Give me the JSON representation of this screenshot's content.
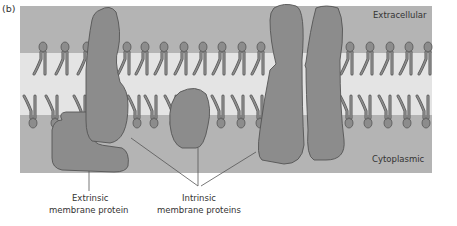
{
  "panel_label": "(b)",
  "regions": {
    "top": "Extracellular",
    "bottom": "Cytoplasmic"
  },
  "callouts": {
    "extrinsic": {
      "line1": "Extrinsic",
      "line2": "membrane protein"
    },
    "intrinsic": {
      "line1": "Intrinsic",
      "line2": "membrane proteins"
    }
  },
  "colors": {
    "outer_band": "#b4b4b4",
    "inner_band": "#e4e4e4",
    "protein": "#8c8c8c",
    "outline": "#555555"
  }
}
